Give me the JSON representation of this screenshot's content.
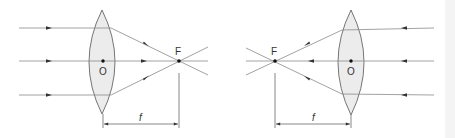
{
  "diagram": {
    "colors": {
      "ray": "#8a8a8a",
      "lens_stroke": "#666666",
      "lens_fill": "#ececec",
      "point": "#111111",
      "label": "#333333"
    },
    "left_panel": {
      "lens_center_label": "O",
      "focal_point_label": "F",
      "focal_length_label": "f",
      "ray_direction": "left-to-right",
      "ray_count": 3
    },
    "right_panel": {
      "lens_center_label": "O",
      "focal_point_label": "F",
      "focal_length_label": "f",
      "ray_direction": "right-to-left",
      "ray_count": 3
    }
  }
}
